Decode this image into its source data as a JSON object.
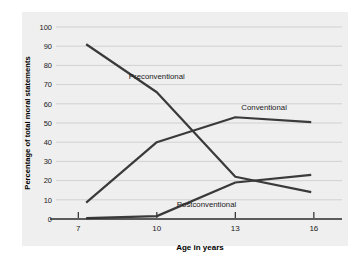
{
  "chart_data": {
    "type": "line",
    "title": "",
    "xlabel": "Age in years",
    "ylabel": "Percentage of total moral statements",
    "x": [
      7.3,
      10,
      13,
      15.9
    ],
    "xtick_values": [
      7,
      10,
      13,
      16
    ],
    "xtick_labels": [
      "7",
      "10",
      "13",
      "16"
    ],
    "xlim": [
      6.3,
      17.0
    ],
    "ytick_values": [
      0,
      10,
      20,
      30,
      40,
      50,
      60,
      70,
      80,
      90,
      100
    ],
    "ytick_labels": [
      "0",
      "10",
      "20",
      "30",
      "40",
      "50",
      "60",
      "70",
      "80",
      "90",
      "100"
    ],
    "ylim": [
      0,
      100
    ],
    "grid": true,
    "legend_position": "inline-annotations",
    "series": [
      {
        "name": "Preconventional",
        "values": [
          91,
          66,
          22,
          14
        ],
        "color": "#3a3a3a",
        "label_text": "Preconventional"
      },
      {
        "name": "Conventional",
        "values": [
          8.5,
          40,
          53,
          50.5
        ],
        "color": "#3a3a3a",
        "label_text": "Conventional"
      },
      {
        "name": "Postconventional",
        "values": [
          0.5,
          1.5,
          19,
          23
        ],
        "color": "#3a3a3a",
        "label_text": "Postconventional"
      }
    ],
    "annotations": [
      {
        "text": "Preconventional",
        "x": 10.0,
        "y": 73
      },
      {
        "text": "Conventional",
        "x": 14.1,
        "y": 57
      },
      {
        "text": "Postconventional",
        "x": 11.9,
        "y": 6
      }
    ]
  },
  "colors": {
    "panel_background": "#efefef",
    "figure_background": "#ffffff",
    "line": "#3a3a3a",
    "grid": "#c9c9c9",
    "axis": "#2b2b2b",
    "text": "#1a1a1a"
  }
}
